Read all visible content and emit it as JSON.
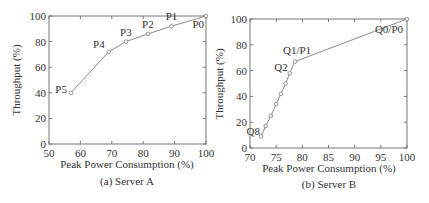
{
  "chart_data": [
    {
      "type": "line",
      "title": "",
      "caption": "(a) Server A",
      "xlabel": "Peak Power Consumption (%)",
      "ylabel": "Throughput (%)",
      "xlim": [
        50,
        100
      ],
      "ylim": [
        0,
        100
      ],
      "xticks": [
        50,
        60,
        70,
        80,
        90,
        100
      ],
      "yticks": [
        0,
        20,
        40,
        60,
        80,
        100
      ],
      "grid": false,
      "points": [
        {
          "label": "P5",
          "x": 57,
          "y": 40
        },
        {
          "label": "P4",
          "x": 69,
          "y": 72
        },
        {
          "label": "P3",
          "x": 74.5,
          "y": 80
        },
        {
          "label": "P2",
          "x": 81.5,
          "y": 86
        },
        {
          "label": "P1",
          "x": 89,
          "y": 92
        },
        {
          "label": "P0",
          "x": 100,
          "y": 100
        }
      ]
    },
    {
      "type": "line",
      "title": "",
      "caption": "(b) Server B",
      "xlabel": "Peak Power Consumption (%)",
      "ylabel": "Throughput (%)",
      "xlim": [
        70,
        100
      ],
      "ylim": [
        0,
        100
      ],
      "xticks": [
        70,
        75,
        80,
        85,
        90,
        95,
        100
      ],
      "yticks": [
        0,
        20,
        40,
        60,
        80,
        100
      ],
      "grid": false,
      "points": [
        {
          "label": "Q8",
          "x": 72.1,
          "y": 9
        },
        {
          "label": "",
          "x": 73,
          "y": 17
        },
        {
          "label": "",
          "x": 74,
          "y": 25
        },
        {
          "label": "",
          "x": 75,
          "y": 34
        },
        {
          "label": "",
          "x": 75.9,
          "y": 42
        },
        {
          "label": "",
          "x": 76.8,
          "y": 50
        },
        {
          "label": "Q2",
          "x": 77.6,
          "y": 58
        },
        {
          "label": "Q1/P1",
          "x": 78.6,
          "y": 67
        },
        {
          "label": "Q0/P0",
          "x": 100,
          "y": 100
        }
      ]
    }
  ],
  "charts": {
    "a": {
      "caption": "(a) Server A",
      "xlabel": "Peak Power Consumption (%)",
      "ylabel": "Throughput (%)"
    },
    "b": {
      "caption": "(b) Server B",
      "xlabel": "Peak Power Consumption (%)",
      "ylabel": "Throughput (%)"
    }
  },
  "colors": {
    "line": "#8a8a8a",
    "axis": "#777777",
    "marker": "#8a8a8a"
  }
}
